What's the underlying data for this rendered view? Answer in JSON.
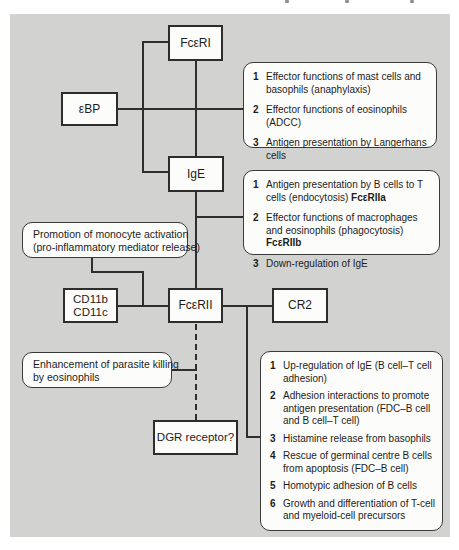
{
  "colors": {
    "panel_bg": "#d2d2d0",
    "line": "#2e2e2e",
    "box_bg": "#fcfcfa"
  },
  "nodes": {
    "fceri": {
      "label": "FcεRI"
    },
    "ebp": {
      "label": "εBP"
    },
    "ige": {
      "label": "IgE"
    },
    "cd11": {
      "line1": "CD11b",
      "line2": "CD11c"
    },
    "fcerii": {
      "label": "FcεRII"
    },
    "cr2": {
      "label": "CR2"
    },
    "dgr": {
      "label": "DGR receptor?"
    }
  },
  "callouts": {
    "promotion": {
      "line1": "Promotion of monocyte activation",
      "line2": "(pro-inflammatory mediator release)"
    },
    "enhancement": {
      "line1": "Enhancement of parasite killing",
      "line2": "by eosinophils"
    }
  },
  "lists": {
    "fceri_functions": {
      "items": [
        {
          "num": "1",
          "text": "Effector functions of mast cells and basophils (anaphylaxis)"
        },
        {
          "num": "2",
          "text": "Effector functions of eosinophils (ADCC)"
        },
        {
          "num": "3",
          "text": "Antigen presentation by Langerhans cells"
        }
      ]
    },
    "ige_functions": {
      "items": [
        {
          "num": "1",
          "text": "Antigen presentation by B cells to T cells (endocytosis) ",
          "bold": "FcεRIIa"
        },
        {
          "num": "2",
          "text": "Effector functions of macrophages and eosinophils (phagocytosis) ",
          "bold": "FcεRIIb"
        },
        {
          "num": "3",
          "text": "Down-regulation of IgE"
        }
      ]
    },
    "fcerii_functions": {
      "items": [
        {
          "num": "1",
          "text": "Up-regulation of IgE (B cell–T cell adhesion)"
        },
        {
          "num": "2",
          "text": "Adhesion interactions to promote antigen presentation (FDC–B cell and B cell–T cell)"
        },
        {
          "num": "3",
          "text": "Histamine release from basophils"
        },
        {
          "num": "4",
          "text": "Rescue of germinal centre B cells from apoptosis (FDC–B cell)"
        },
        {
          "num": "5",
          "text": "Homotypic adhesion of B cells"
        },
        {
          "num": "6",
          "text": "Growth and differentiation of T-cell and myeloid-cell precursors"
        }
      ]
    }
  }
}
